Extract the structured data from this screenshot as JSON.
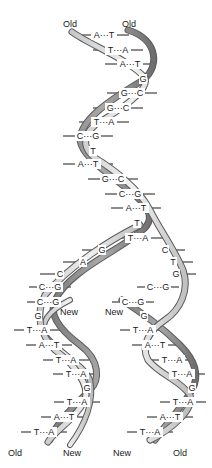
{
  "diagram": {
    "colors": {
      "strand_light": "#d9d9d9",
      "strand_dark": "#8a8a8a",
      "strand_outline": "#5a5a5a",
      "bond_line": "#1a1a1a",
      "text": "#1a1a1a"
    },
    "labels": {
      "top_left": "Old",
      "top_right": "Old",
      "fork_new_left": "New",
      "fork_new_right": "New",
      "bottom_left_1": "Old",
      "bottom_left_2": "New",
      "bottom_right_1": "New",
      "bottom_right_2": "Old"
    },
    "parent_pairs": [
      {
        "y": 35,
        "x": 104,
        "text": "A···T"
      },
      {
        "y": 50,
        "x": 118,
        "text": "T···A"
      },
      {
        "y": 64,
        "x": 130,
        "text": "A···T"
      },
      {
        "y": 79,
        "x": 143,
        "text": "G"
      },
      {
        "y": 93,
        "x": 132,
        "text": "G···C"
      },
      {
        "y": 108,
        "x": 118,
        "text": "G···C"
      },
      {
        "y": 122,
        "x": 104,
        "text": "T···A"
      },
      {
        "y": 136,
        "x": 88,
        "text": "C···G"
      },
      {
        "y": 151,
        "x": 93,
        "text": "T"
      },
      {
        "y": 164,
        "x": 88,
        "text": "A···T"
      },
      {
        "y": 179,
        "x": 113,
        "text": "G···C"
      },
      {
        "y": 194,
        "x": 130,
        "text": "C···G"
      },
      {
        "y": 208,
        "x": 136,
        "text": "A···T"
      },
      {
        "y": 223,
        "x": 137,
        "text": "T"
      },
      {
        "y": 238,
        "x": 138,
        "text": "T···A"
      }
    ],
    "fork_left": [
      {
        "y": 250,
        "x": 102,
        "text": "G"
      },
      {
        "y": 262,
        "x": 83,
        "text": "A"
      },
      {
        "y": 274,
        "x": 60,
        "text": "C"
      },
      {
        "y": 287,
        "x": 50,
        "text": "C···G"
      },
      {
        "y": 302,
        "x": 48,
        "text": "C···G"
      }
    ],
    "fork_right": [
      {
        "y": 250,
        "x": 165,
        "text": "C"
      },
      {
        "y": 262,
        "x": 173,
        "text": "T"
      },
      {
        "y": 274,
        "x": 176,
        "text": "G"
      },
      {
        "y": 287,
        "x": 158,
        "text": "C···G"
      },
      {
        "y": 302,
        "x": 133,
        "text": "C···G"
      }
    ],
    "daughter_left": [
      {
        "y": 316,
        "x": 38,
        "text": "G"
      },
      {
        "y": 330,
        "x": 37,
        "text": "T···A"
      },
      {
        "y": 345,
        "x": 49,
        "text": "A···T"
      },
      {
        "y": 360,
        "x": 66,
        "text": "T···A"
      },
      {
        "y": 374,
        "x": 76,
        "text": "T···A"
      },
      {
        "y": 388,
        "x": 87,
        "text": "G"
      },
      {
        "y": 402,
        "x": 77,
        "text": "T···A"
      },
      {
        "y": 417,
        "x": 64,
        "text": "A···T"
      },
      {
        "y": 432,
        "x": 44,
        "text": "T···A"
      }
    ],
    "daughter_right": [
      {
        "y": 316,
        "x": 144,
        "text": "G"
      },
      {
        "y": 330,
        "x": 143,
        "text": "T···A"
      },
      {
        "y": 345,
        "x": 155,
        "text": "A···T"
      },
      {
        "y": 360,
        "x": 172,
        "text": "T···A"
      },
      {
        "y": 374,
        "x": 182,
        "text": "T···A"
      },
      {
        "y": 388,
        "x": 192,
        "text": "G"
      },
      {
        "y": 402,
        "x": 183,
        "text": "T···A"
      },
      {
        "y": 417,
        "x": 170,
        "text": "A···T"
      },
      {
        "y": 432,
        "x": 150,
        "text": "T···A"
      }
    ]
  }
}
